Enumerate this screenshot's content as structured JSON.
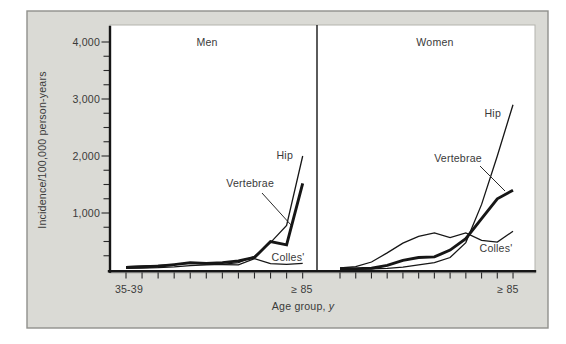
{
  "figure": {
    "y_axis_title": "Incidence/100,000 person-years",
    "x_axis_title": {
      "prefix": "Age group,",
      "suffix_italic": "y"
    },
    "y_tick_labels": [
      "4,000",
      "3,000",
      "2,000",
      "1,000"
    ]
  },
  "chart_data": {
    "type": "line",
    "ylabel": "Incidence/100,000 person-years",
    "xlabel": "Age group, y",
    "ylim": [
      0,
      4300
    ],
    "y_major_ticks": [
      1000,
      2000,
      3000,
      4000
    ],
    "y_minor_tick_step": 250,
    "x_ticks_per_panel": 12,
    "x_axis_range": {
      "first_group": "35-39",
      "last_group": "≥ 85"
    },
    "grid": "off",
    "legend": "inline-labels",
    "panels": [
      {
        "title": "Men",
        "x_first_tick_label": "35-39",
        "x_last_tick_label": "≥ 85",
        "series": [
          {
            "name": "Hip",
            "style": "thin",
            "values": [
              30,
              35,
              40,
              55,
              75,
              90,
              100,
              130,
              240,
              480,
              780,
              2000
            ]
          },
          {
            "name": "Vertebrae",
            "style": "thick",
            "values": [
              45,
              55,
              65,
              95,
              130,
              115,
              130,
              160,
              220,
              500,
              440,
              1520
            ]
          },
          {
            "name": "Colles'",
            "style": "thin",
            "values": [
              60,
              70,
              80,
              95,
              115,
              105,
              95,
              90,
              200,
              110,
              100,
              115
            ]
          }
        ]
      },
      {
        "title": "Women",
        "x_first_tick_label": "",
        "x_last_tick_label": "≥ 85",
        "series": [
          {
            "name": "Hip",
            "style": "thin",
            "values": [
              10,
              15,
              20,
              30,
              50,
              90,
              130,
              220,
              480,
              1150,
              2000,
              2900
            ]
          },
          {
            "name": "Vertebrae",
            "style": "thick",
            "values": [
              25,
              25,
              30,
              80,
              170,
              220,
              230,
              350,
              550,
              900,
              1250,
              1400
            ]
          },
          {
            "name": "Colles'",
            "style": "thin",
            "values": [
              35,
              60,
              140,
              300,
              470,
              590,
              650,
              570,
              650,
              520,
              490,
              680
            ]
          }
        ]
      }
    ]
  },
  "colors": {
    "page_bg": "#ffffff",
    "card_bg": "#dadad5",
    "card_border": "#90908c",
    "plot_bg": "#ffffff",
    "line": "#161616",
    "text": "#3a3a3a"
  }
}
